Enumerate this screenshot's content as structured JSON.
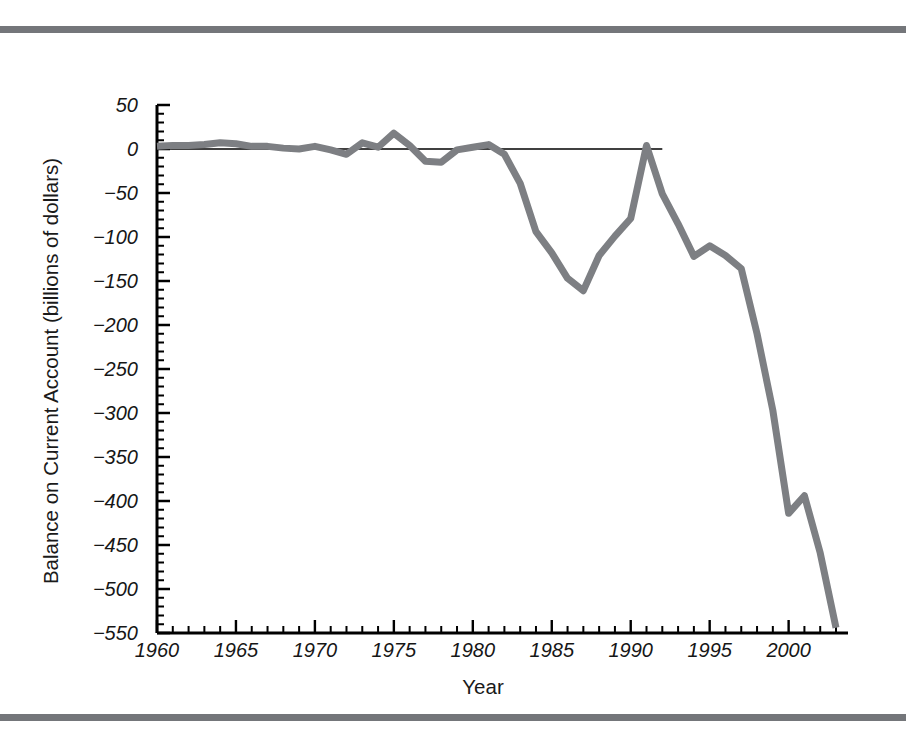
{
  "figure": {
    "decoration": {
      "top_rule_color": "#74767a",
      "bottom_rule_color": "#74767a"
    }
  },
  "chart_data": {
    "type": "line",
    "title": "",
    "xlabel": "Year",
    "ylabel": "Balance on Current Account (billions of dollars)",
    "xlim": [
      1960,
      2003
    ],
    "ylim": [
      -550,
      50
    ],
    "xticks": [
      1960,
      1965,
      1970,
      1975,
      1980,
      1985,
      1990,
      1995,
      2000
    ],
    "xtick_labels": [
      "1960",
      "1965",
      "1970",
      "1975",
      "1980",
      "1985",
      "1990",
      "1995",
      "2000"
    ],
    "xminor_tick_step": 1,
    "yticks": [
      50,
      0,
      -50,
      -100,
      -150,
      -200,
      -250,
      -300,
      -350,
      -400,
      -450,
      -500,
      -550
    ],
    "ytick_labels": [
      "50",
      "0",
      "-50",
      "-100",
      "-150",
      "-200",
      "-250",
      "-300",
      "-350",
      "-400",
      "-450",
      "-500",
      "-550"
    ],
    "yminor_tick_step": 10,
    "grid": false,
    "legend": null,
    "zero_reference_line": {
      "y": 0,
      "x_start": 1960,
      "x_end": 1992,
      "color": "#000000"
    },
    "series": [
      {
        "name": "Balance on Current Account",
        "color": "#7d7f83",
        "line_width": 7,
        "x": [
          1960,
          1961,
          1962,
          1963,
          1964,
          1965,
          1966,
          1967,
          1968,
          1969,
          1970,
          1971,
          1972,
          1973,
          1974,
          1975,
          1976,
          1977,
          1978,
          1979,
          1980,
          1981,
          1982,
          1983,
          1984,
          1985,
          1986,
          1987,
          1988,
          1989,
          1990,
          1991,
          1992,
          1993,
          1994,
          1995,
          1996,
          1997,
          1998,
          1999,
          2000,
          2001,
          2002,
          2003
        ],
        "values": [
          3,
          4,
          4,
          5,
          7,
          6,
          3,
          3,
          1,
          0,
          3,
          -1,
          -6,
          7,
          2,
          18,
          4,
          -14,
          -15,
          -1,
          2,
          5,
          -6,
          -39,
          -94,
          -118,
          -147,
          -161,
          -121,
          -99,
          -79,
          4,
          -51,
          -85,
          -122,
          -110,
          -121,
          -136,
          -210,
          -297,
          -414,
          -394,
          -459,
          -544
        ]
      }
    ]
  }
}
